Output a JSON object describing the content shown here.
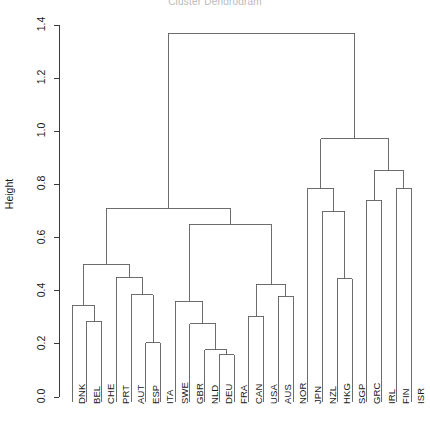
{
  "chart_data": {
    "type": "dendrogram",
    "title": "Cluster Dendrogram",
    "xlabel": "",
    "ylabel": "Height",
    "ylim": [
      0.0,
      1.4
    ],
    "y_ticks": [
      "0.0",
      "0.2",
      "0.4",
      "0.6",
      "0.8",
      "1.0",
      "1.2",
      "1.4"
    ],
    "y_tick_values": [
      0.0,
      0.2,
      0.4,
      0.6,
      0.8,
      1.0,
      1.2,
      1.4
    ],
    "grid": false,
    "legend": "none",
    "leaf_order": [
      "DNK",
      "BEL",
      "CHE",
      "PRT",
      "AUT",
      "ESP",
      "ITA",
      "SWE",
      "GBR",
      "NLD",
      "DEU",
      "FRA",
      "CAN",
      "USA",
      "AUS",
      "NOR",
      "JPN",
      "NZL",
      "HKG",
      "SGP",
      "GRC",
      "IRL",
      "FIN",
      "ISR"
    ],
    "n_leaves": 24,
    "merges": [
      {
        "id": "m1",
        "height": 0.285,
        "children": [
          "BEL",
          "CHE"
        ]
      },
      {
        "id": "m2",
        "height": 0.345,
        "children": [
          "DNK",
          "m1"
        ]
      },
      {
        "id": "m3",
        "height": 0.205,
        "children": [
          "ESP",
          "ITA"
        ]
      },
      {
        "id": "m4",
        "height": 0.385,
        "children": [
          "AUT",
          "m3"
        ]
      },
      {
        "id": "m5",
        "height": 0.45,
        "children": [
          "PRT",
          "m4"
        ]
      },
      {
        "id": "m6",
        "height": 0.5,
        "children": [
          "m2",
          "m5"
        ]
      },
      {
        "id": "m7",
        "height": 0.16,
        "children": [
          "DEU",
          "FRA"
        ]
      },
      {
        "id": "m8",
        "height": 0.178,
        "children": [
          "NLD",
          "m7"
        ]
      },
      {
        "id": "m9",
        "height": 0.275,
        "children": [
          "GBR",
          "m8"
        ]
      },
      {
        "id": "m10",
        "height": 0.36,
        "children": [
          "SWE",
          "m9"
        ]
      },
      {
        "id": "m11",
        "height": 0.305,
        "children": [
          "CAN",
          "USA"
        ]
      },
      {
        "id": "m12",
        "height": 0.38,
        "children": [
          "AUS",
          "NOR"
        ]
      },
      {
        "id": "m13",
        "height": 0.425,
        "children": [
          "m11",
          "m12"
        ]
      },
      {
        "id": "m14",
        "height": 0.65,
        "children": [
          "m10",
          "m13"
        ]
      },
      {
        "id": "m15",
        "height": 0.71,
        "children": [
          "m6",
          "m14"
        ]
      },
      {
        "id": "m16",
        "height": 0.445,
        "children": [
          "HKG",
          "SGP"
        ]
      },
      {
        "id": "m17",
        "height": 0.7,
        "children": [
          "NZL",
          "m16"
        ]
      },
      {
        "id": "m18",
        "height": 0.785,
        "children": [
          "JPN",
          "m17"
        ]
      },
      {
        "id": "m19",
        "height": 0.74,
        "children": [
          "GRC",
          "IRL"
        ]
      },
      {
        "id": "m20",
        "height": 0.785,
        "children": [
          "FIN",
          "ISR"
        ]
      },
      {
        "id": "m21",
        "height": 0.852,
        "children": [
          "m19",
          "m20"
        ]
      },
      {
        "id": "m22",
        "height": 0.972,
        "children": [
          "m18",
          "m21"
        ]
      },
      {
        "id": "m23",
        "height": 1.37,
        "children": [
          "m15",
          "m22"
        ]
      }
    ],
    "root": "m23",
    "colors": {
      "line": "#5d5d5d",
      "axis": "#3a3a3a",
      "text": "#1a1a1a",
      "background": "#ffffff"
    }
  }
}
